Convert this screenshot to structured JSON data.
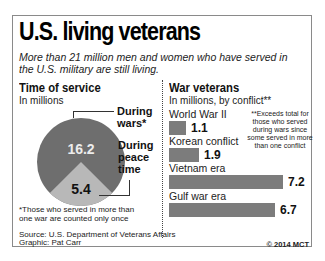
{
  "header": {
    "title": "U.S. living veterans",
    "subtitle": "More than 21 million men and women who have served in the U.S. military are still living."
  },
  "left_panel": {
    "title": "Time of service",
    "subtitle": "In millions",
    "label_wars": "During wars*",
    "label_peace": "During peace time",
    "footnote": "*Those who served in more than one war are counted only once"
  },
  "right_panel": {
    "title": "War veterans",
    "subtitle": "In millions, by conflict**",
    "side_note": "**Exceeds total for those who served during wars since some served in more than one conflict"
  },
  "footer": {
    "source": "Source: U.S. Department of Veterans Affairs",
    "graphic": "Graphic: Pat Carr",
    "copyright": "© 2014 MCT"
  },
  "colors": {
    "pie_wars": "#6e6e6e",
    "pie_peace": "#b8b8b8",
    "bar": "#7c7c7c"
  },
  "chart_data": [
    {
      "type": "pie",
      "title": "Time of service",
      "subtitle": "In millions",
      "categories": [
        "During wars*",
        "During peace time"
      ],
      "values": [
        16.2,
        5.4
      ],
      "labels": [
        "16.2",
        "5.4"
      ]
    },
    {
      "type": "bar",
      "orientation": "horizontal",
      "title": "War veterans",
      "subtitle": "In millions, by conflict**",
      "categories": [
        "World War II",
        "Korean conflict",
        "Vietnam era",
        "Gulf war era"
      ],
      "values": [
        1.1,
        1.9,
        7.2,
        6.7
      ],
      "labels": [
        "1.1",
        "1.9",
        "7.2",
        "6.7"
      ],
      "annotation": "**Exceeds total for those who served during wars since some served in more than one conflict"
    }
  ]
}
